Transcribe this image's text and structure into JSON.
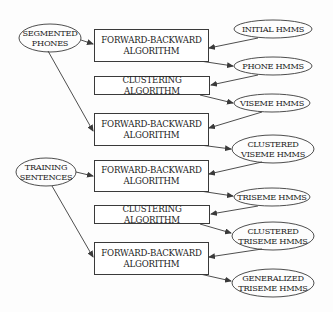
{
  "diagram": {
    "inputs": [
      {
        "id": "segmented-phones",
        "label": "SEGMENTED\nPHONES"
      },
      {
        "id": "training-sentences",
        "label": "TRAINING\nSENTENCES"
      }
    ],
    "processes": [
      {
        "id": "fb1",
        "label": "FORWARD-BACKWARD\nALGORITHM"
      },
      {
        "id": "cl1",
        "label": "CLUSTERING ALGORITHM"
      },
      {
        "id": "fb2",
        "label": "FORWARD-BACKWARD\nALGORITHM"
      },
      {
        "id": "fb3",
        "label": "FORWARD-BACKWARD\nALGORITHM"
      },
      {
        "id": "cl2",
        "label": "CLUSTERING ALGORITHM"
      },
      {
        "id": "fb4",
        "label": "FORWARD-BACKWARD\nALGORITHM"
      }
    ],
    "models": [
      {
        "id": "initial-hmms",
        "label": "INITIAL HMMS"
      },
      {
        "id": "phone-hmms",
        "label": "PHONE HMMS"
      },
      {
        "id": "viseme-hmms",
        "label": "VISEME HMMS"
      },
      {
        "id": "clustered-viseme-hmms",
        "label": "CLUSTERED\nVISEME HMMS"
      },
      {
        "id": "triseme-hmms",
        "label": "TRISEME HMMS"
      },
      {
        "id": "clustered-triseme-hmms",
        "label": "CLUSTERED\nTRISEME HMMS"
      },
      {
        "id": "generalized-triseme-hmms",
        "label": "GENERALIZED\nTRISEME HMMS"
      }
    ],
    "edges": [
      {
        "from": "segmented-phones",
        "to": "fb1"
      },
      {
        "from": "segmented-phones",
        "to": "fb2"
      },
      {
        "from": "training-sentences",
        "to": "fb3"
      },
      {
        "from": "training-sentences",
        "to": "fb4"
      },
      {
        "from": "initial-hmms",
        "to": "fb1"
      },
      {
        "from": "fb1",
        "to": "phone-hmms"
      },
      {
        "from": "phone-hmms",
        "to": "cl1"
      },
      {
        "from": "cl1",
        "to": "viseme-hmms"
      },
      {
        "from": "viseme-hmms",
        "to": "fb2"
      },
      {
        "from": "fb2",
        "to": "clustered-viseme-hmms"
      },
      {
        "from": "clustered-viseme-hmms",
        "to": "fb3"
      },
      {
        "from": "fb3",
        "to": "triseme-hmms"
      },
      {
        "from": "triseme-hmms",
        "to": "cl2"
      },
      {
        "from": "cl2",
        "to": "clustered-triseme-hmms"
      },
      {
        "from": "clustered-triseme-hmms",
        "to": "fb4"
      },
      {
        "from": "fb4",
        "to": "generalized-triseme-hmms"
      }
    ],
    "colors": {
      "stroke": "#3a3a3a",
      "text": "#222222",
      "background": "#fdfdfd"
    }
  }
}
